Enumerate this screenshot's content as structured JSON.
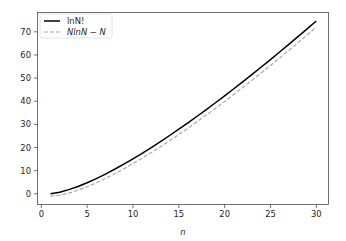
{
  "chart_data": {
    "type": "line",
    "title": "",
    "xlabel": "n",
    "ylabel": "",
    "xlim": [
      -0.45,
      31.45
    ],
    "ylim": [
      -4.8,
      78.4
    ],
    "grid": false,
    "legend_position": "upper left",
    "x_ticks": [
      0,
      5,
      10,
      15,
      20,
      25,
      30
    ],
    "y_ticks": [
      0,
      10,
      20,
      30,
      40,
      50,
      60,
      70
    ],
    "x": [
      1,
      2,
      3,
      4,
      5,
      6,
      7,
      8,
      9,
      10,
      11,
      12,
      13,
      14,
      15,
      16,
      17,
      18,
      19,
      20,
      21,
      22,
      23,
      24,
      25,
      26,
      27,
      28,
      29,
      30
    ],
    "series": [
      {
        "name": "lnN!",
        "legend_label": "lnN!",
        "color": "#000000",
        "style": "solid",
        "values": [
          0,
          0.693,
          1.792,
          3.178,
          4.787,
          6.579,
          8.525,
          10.605,
          12.802,
          15.104,
          17.502,
          19.987,
          22.552,
          25.191,
          27.899,
          30.672,
          33.505,
          36.395,
          39.34,
          42.336,
          45.38,
          48.471,
          51.607,
          54.785,
          58.004,
          61.262,
          64.558,
          67.89,
          71.257,
          74.658
        ]
      },
      {
        "name": "NlnN - N",
        "legend_label": "NlnN − N",
        "color": "#aaaaaa",
        "style": "dashed",
        "values": [
          -1,
          -0.614,
          0.296,
          1.545,
          3.047,
          4.751,
          6.621,
          8.636,
          10.775,
          13.026,
          15.377,
          17.819,
          20.344,
          22.947,
          25.621,
          28.361,
          31.165,
          34.027,
          36.944,
          39.915,
          42.935,
          46.003,
          49.116,
          52.273,
          55.472,
          58.711,
          61.989,
          65.303,
          68.653,
          72.036
        ]
      }
    ]
  },
  "legend": {
    "items": [
      {
        "label": "lnN!"
      },
      {
        "label": "NlnN − N"
      }
    ]
  }
}
